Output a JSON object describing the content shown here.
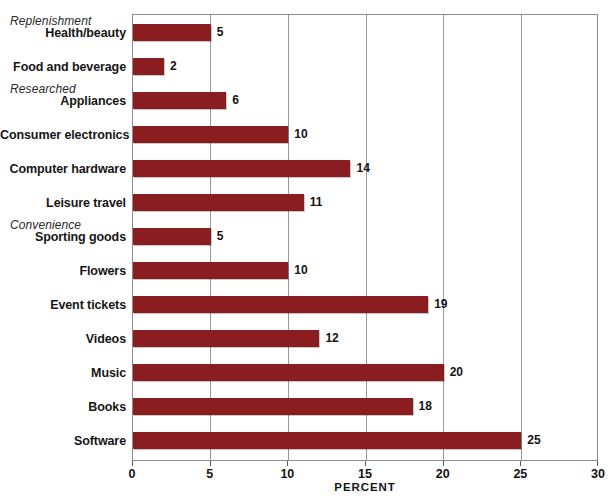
{
  "chart_data": {
    "type": "bar",
    "orientation": "horizontal",
    "title": "",
    "xlabel": "PERCENT",
    "ylabel": "",
    "xlim": [
      0,
      30
    ],
    "xticks": [
      0,
      5,
      10,
      15,
      20,
      25,
      30
    ],
    "xtick_labels": [
      "0",
      "5",
      "10",
      "15",
      "20",
      "25",
      "30"
    ],
    "grid": "vertical",
    "legend": "none",
    "bar_color": "#8a1d20",
    "categories": [
      "Health/beauty",
      "Food and beverage",
      "Appliances",
      "Consumer electronics",
      "Computer hardware",
      "Leisure travel",
      "Sporting goods",
      "Flowers",
      "Event tickets",
      "Videos",
      "Music",
      "Books",
      "Software"
    ],
    "values": [
      5,
      2,
      6,
      10,
      14,
      11,
      5,
      10,
      19,
      12,
      20,
      18,
      25
    ],
    "value_labels": [
      "5",
      "2",
      "6",
      "10",
      "14",
      "11",
      "5",
      "10",
      "19",
      "12",
      "20",
      "18",
      "25"
    ],
    "group_headers": [
      {
        "label": "Replenishment",
        "before_category": "Health/beauty"
      },
      {
        "label": "Researched",
        "before_category": "Appliances"
      },
      {
        "label": "Convenience",
        "before_category": "Sporting goods"
      }
    ],
    "annotations": []
  }
}
